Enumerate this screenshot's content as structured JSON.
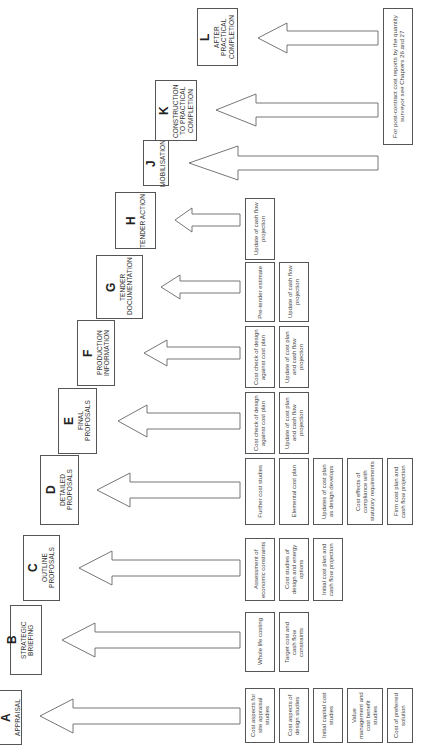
{
  "diagram": {
    "orientation": "rotated 90deg counter-clockwise",
    "stages": [
      {
        "letter": "A",
        "name": "APPRAISAL",
        "activities": [
          "Cost aspects for site appraisal studies",
          "Cost aspects of design studies",
          "Initial capital cost studies",
          "Value management and cost benefit studies",
          "Cost of preferred solution"
        ]
      },
      {
        "letter": "B",
        "name": "STRATEGIC BRIEFING",
        "activities": [
          "Whole life costing",
          "Target cost and cash flow constraints"
        ]
      },
      {
        "letter": "C",
        "name": "OUTLINE PROPOSALS",
        "activities": [
          "Assessment of economic constraints",
          "Cost studies of design and energy options",
          "Initial cost plan and cash flow projection"
        ]
      },
      {
        "letter": "D",
        "name": "DETAILED PROPOSALS",
        "activities": [
          "Further cost studies",
          "Elemental cost plan",
          "Updates of cost plan as design develops",
          "Cost effects of compliance with statutory requirements",
          "Firm cost plan and cash flow projection"
        ]
      },
      {
        "letter": "E",
        "name": "FINAL PROPOSALS",
        "activities": [
          "Cost check of design against cost plan",
          "Update of cost plan and cash flow projection"
        ]
      },
      {
        "letter": "F",
        "name": "PRODUCTION INFORMATION",
        "activities": [
          "Cost check of design against cost plan",
          "Update of cost plan and cash flow projection"
        ]
      },
      {
        "letter": "G",
        "name": "TENDER DOCUMENTATION",
        "activities": [
          "Pre-tender estimate",
          "Update of cash flow projection"
        ]
      },
      {
        "letter": "H",
        "name": "TENDER ACTION",
        "activities": [
          "Update of cash flow projection"
        ]
      },
      {
        "letter": "J",
        "name": "MOBILISATION",
        "activities": []
      },
      {
        "letter": "K",
        "name": "CONSTRUCTION TO PRACTICAL COMPLETION",
        "activities": []
      },
      {
        "letter": "L",
        "name": "AFTER PRACTICAL COMPLETION",
        "activities": []
      }
    ],
    "note": "For post-contract cost reports by the quantity surveyor see Chapters 26 and 27"
  }
}
